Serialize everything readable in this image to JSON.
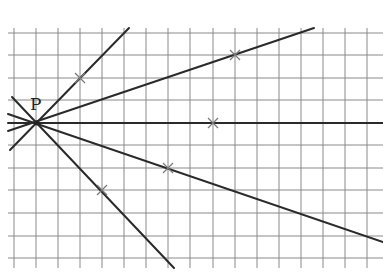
{
  "diagram": {
    "point_label": "P",
    "point": {
      "x": 37,
      "y": 123
    },
    "label_pos": {
      "x": 30,
      "y": 110
    },
    "grid": {
      "x_lines": [
        14,
        36,
        58,
        80,
        102,
        124,
        146,
        168,
        190,
        213,
        235,
        257,
        279,
        301,
        323,
        345,
        367
      ],
      "y_lines": [
        33,
        55,
        78,
        100,
        123,
        145,
        168,
        190,
        213,
        236,
        258
      ],
      "x_min": 8,
      "x_max": 383,
      "y_min": 28,
      "y_max": 268
    },
    "rays": [
      {
        "name": "ray-steep-up",
        "from": [
          10,
          150
        ],
        "to": [
          129,
          28
        ]
      },
      {
        "name": "ray-shallow-up",
        "from": [
          8,
          131
        ],
        "to": [
          314,
          28
        ]
      },
      {
        "name": "ray-horizontal",
        "from": [
          8,
          123
        ],
        "to": [
          383,
          123
        ]
      },
      {
        "name": "ray-shallow-down",
        "from": [
          8,
          114
        ],
        "to": [
          383,
          242
        ]
      },
      {
        "name": "ray-steep-down",
        "from": [
          12,
          97
        ],
        "to": [
          174,
          268
        ]
      }
    ],
    "crosses": [
      {
        "x": 80,
        "y": 78
      },
      {
        "x": 235,
        "y": 55
      },
      {
        "x": 213,
        "y": 123
      },
      {
        "x": 168,
        "y": 168
      },
      {
        "x": 102,
        "y": 190
      }
    ],
    "colors": {
      "grid": "#8a8a8a",
      "ray": "#2a2a2a",
      "cross": "#7a7a7a"
    }
  }
}
